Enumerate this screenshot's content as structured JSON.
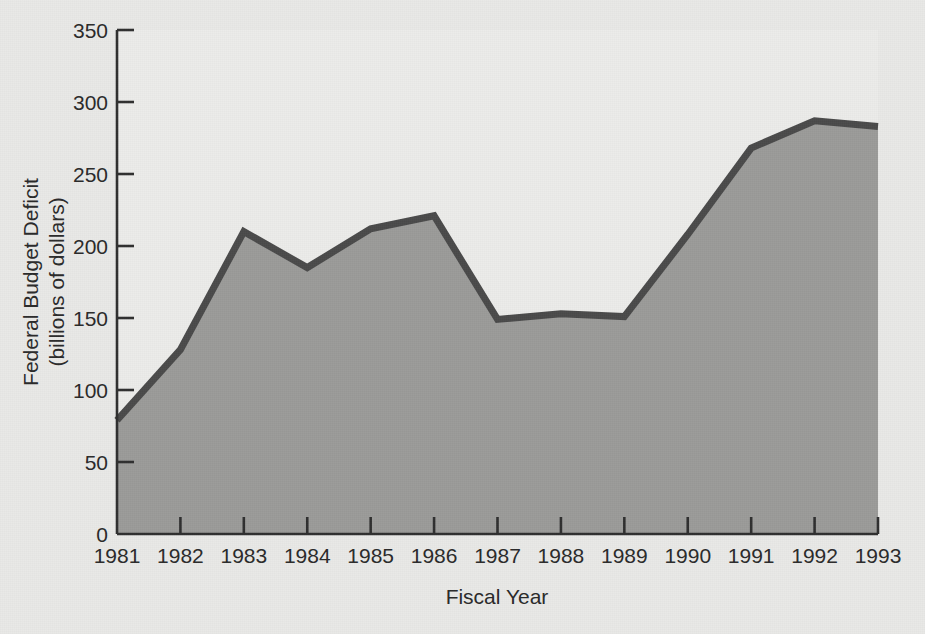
{
  "chart_data": {
    "type": "area",
    "title": "",
    "xlabel": "Fiscal Year",
    "ylabel": "Federal Budget Deficit (billions of dollars)",
    "ylabel_line1": "Federal Budget Deficit",
    "ylabel_line2": "(billions of dollars)",
    "categories": [
      "1981",
      "1982",
      "1983",
      "1984",
      "1985",
      "1986",
      "1987",
      "1988",
      "1989",
      "1990",
      "1991",
      "1992",
      "1993"
    ],
    "x": [
      1981,
      1982,
      1983,
      1984,
      1985,
      1986,
      1987,
      1988,
      1989,
      1990,
      1991,
      1992,
      1993
    ],
    "values": [
      79,
      128,
      210,
      185,
      212,
      221,
      149,
      153,
      151,
      208,
      268,
      287,
      283
    ],
    "series": [
      {
        "name": "Federal Budget Deficit",
        "values": [
          79,
          128,
          210,
          185,
          212,
          221,
          149,
          153,
          151,
          208,
          268,
          287,
          283
        ]
      }
    ],
    "ylim": [
      0,
      350
    ],
    "xlim": [
      1981,
      1993
    ],
    "ytick_labels": [
      "0",
      "50",
      "100",
      "150",
      "200",
      "250",
      "300",
      "350"
    ],
    "yticks": [
      0,
      50,
      100,
      150,
      200,
      250,
      300,
      350
    ],
    "xtick_labels": [
      "1981",
      "1982",
      "1983",
      "1984",
      "1985",
      "1986",
      "1987",
      "1988",
      "1989",
      "1990",
      "1991",
      "1992",
      "1993"
    ],
    "grid": false,
    "legend": false,
    "legend_position": "none",
    "annotations": []
  },
  "style": {
    "background_color": "#e9e9e7",
    "plot_background_color": "#ececeb",
    "area_fill_color": "#9b9b99",
    "line_color": "#4a4a4a",
    "axis_color": "#2f2f2f",
    "text_color": "#2a2a2a"
  }
}
